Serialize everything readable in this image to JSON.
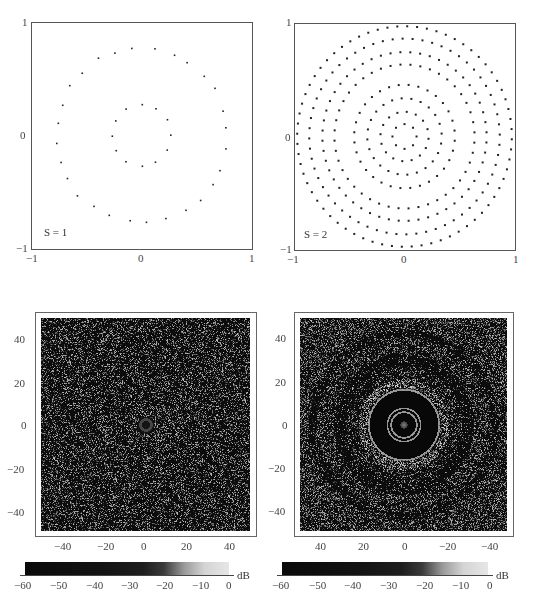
{
  "figure": {
    "panels": [
      {
        "id": "top-left",
        "label": "S = 1",
        "type": "scatter",
        "x_ticks": [
          "−1",
          "0",
          "1"
        ],
        "y_ticks": [
          "1",
          "0",
          "−1"
        ],
        "xlim": [
          -1,
          1
        ],
        "ylim": [
          -1,
          1
        ]
      },
      {
        "id": "top-right",
        "label": "S = 2",
        "type": "scatter",
        "x_ticks": [
          "−1",
          "0",
          "1"
        ],
        "y_ticks": [
          "1",
          "0",
          "−1"
        ],
        "xlim": [
          -1,
          1
        ],
        "ylim": [
          -1,
          1
        ]
      },
      {
        "id": "bottom-left",
        "type": "heatmap",
        "x_ticks": [
          "−40",
          "−20",
          "0",
          "20",
          "40"
        ],
        "y_ticks": [
          "40",
          "20",
          "0",
          "−20",
          "−40"
        ],
        "colorbar": {
          "ticks": [
            "−60",
            "−50",
            "−40",
            "−30",
            "−20",
            "−10",
            "0"
          ],
          "unit": "dB"
        }
      },
      {
        "id": "bottom-right",
        "type": "heatmap",
        "x_ticks": [
          "40",
          "20",
          "0",
          "−20",
          "−40"
        ],
        "y_ticks": [
          "40",
          "20",
          "0",
          "−20",
          "−40"
        ],
        "colorbar": {
          "ticks": [
            "−60",
            "−50",
            "−40",
            "−30",
            "−20",
            "−10",
            "0"
          ],
          "unit": "dB"
        }
      }
    ]
  },
  "chart_data": [
    {
      "type": "scatter",
      "title": "S = 1",
      "xlabel": "",
      "ylabel": "",
      "xlim": [
        -1,
        1
      ],
      "ylim": [
        -1,
        1
      ],
      "grid": false,
      "description": "Sparse array: ~12 elements on inner ring (r≈0.27) and ~28 elements on outer ring (r≈0.78), slightly irregular spacing",
      "rings": [
        {
          "radius": 0.27,
          "count": 12
        },
        {
          "radius": 0.78,
          "count": 28
        }
      ]
    },
    {
      "type": "scatter",
      "title": "S = 2",
      "xlabel": "",
      "ylabel": "",
      "xlim": [
        -1,
        1
      ],
      "ylim": [
        -1,
        1
      ],
      "grid": false,
      "description": "Dense concentric-ring array: 9 rings of elements",
      "rings": [
        {
          "radius": 0.11,
          "count": 8
        },
        {
          "radius": 0.22,
          "count": 16
        },
        {
          "radius": 0.34,
          "count": 24
        },
        {
          "radius": 0.46,
          "count": 32
        },
        {
          "radius": 0.64,
          "count": 44
        },
        {
          "radius": 0.75,
          "count": 52
        },
        {
          "radius": 0.87,
          "count": 60
        },
        {
          "radius": 0.98,
          "count": 68
        },
        {
          "radius": 1.0,
          "count": 0
        }
      ]
    },
    {
      "type": "heatmap",
      "title": "",
      "xlim": [
        -50,
        50
      ],
      "ylim": [
        -50,
        50
      ],
      "x_ticks": [
        -40,
        -20,
        0,
        20,
        40
      ],
      "y_ticks": [
        40,
        20,
        0,
        -20,
        -40
      ],
      "colorbar": {
        "min": -60,
        "max": 0,
        "unit": "dB",
        "ticks": [
          -60,
          -50,
          -40,
          -30,
          -20,
          -10,
          0
        ]
      },
      "description": "Beam pattern for S=1: speckle-like sidelobes throughout, small main lobe ring at center (r≈3)"
    },
    {
      "type": "heatmap",
      "title": "",
      "xlim": [
        50,
        -50
      ],
      "ylim": [
        -50,
        50
      ],
      "x_ticks": [
        40,
        20,
        0,
        -20,
        -40
      ],
      "y_ticks": [
        40,
        20,
        0,
        -20,
        -40
      ],
      "colorbar": {
        "min": -60,
        "max": 0,
        "unit": "dB",
        "ticks": [
          -60,
          -50,
          -40,
          -30,
          -20,
          -10,
          0
        ]
      },
      "description": "Beam pattern for S=2: clean dark zone up to r≈17 with bright rings at r≈6, 8, 17; grating-lobe ring ≈ r 20; diffuse sidelobe rings beyond"
    }
  ]
}
